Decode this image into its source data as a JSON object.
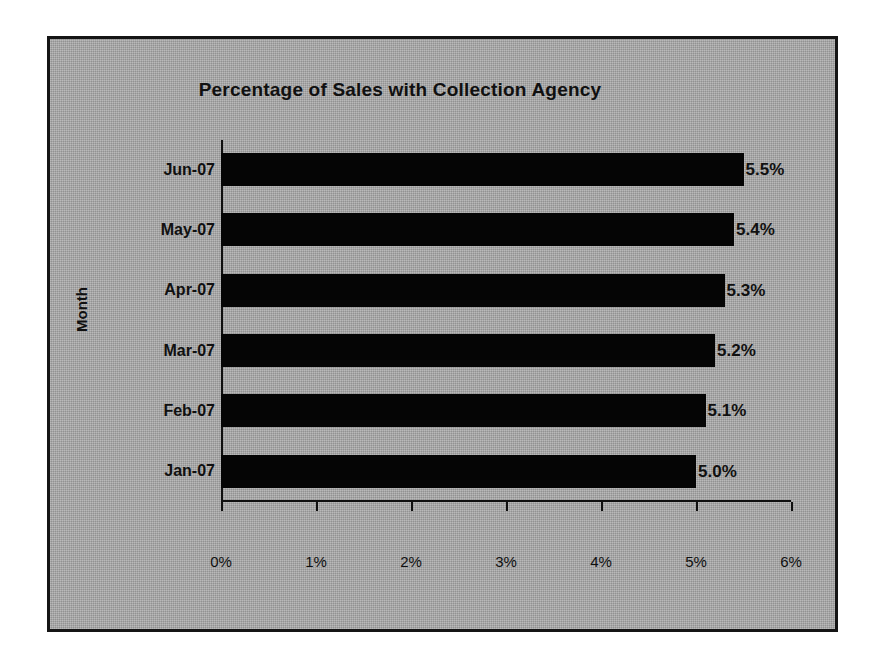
{
  "chart_data": {
    "type": "bar",
    "orientation": "horizontal",
    "title": "Percentage of Sales with Collection Agency",
    "xlabel": "",
    "ylabel": "Month",
    "categories": [
      "Jun-07",
      "May-07",
      "Apr-07",
      "Mar-07",
      "Feb-07",
      "Jan-07"
    ],
    "values": [
      5.5,
      5.4,
      5.3,
      5.2,
      5.1,
      5.0
    ],
    "data_labels": [
      "5.5%",
      "5.4%",
      "5.3%",
      "5.2%",
      "5.1%",
      "5.0%"
    ],
    "xlim": [
      0,
      6
    ],
    "x_tick_labels": [
      "0%",
      "1%",
      "2%",
      "3%",
      "4%",
      "5%",
      "6%"
    ],
    "x_tick_values": [
      0,
      1,
      2,
      3,
      4,
      5,
      6
    ],
    "grid": false,
    "legend": false,
    "series": [
      {
        "name": "Percentage of Sales with Collection Agency",
        "values": [
          5.5,
          5.4,
          5.3,
          5.2,
          5.1,
          5.0
        ]
      }
    ],
    "colors": {
      "bar": "#050505",
      "plot_background": "#a9a9a9",
      "chart_background": "#a9a9a9",
      "border": "#151515",
      "text": "#101010",
      "page_background": "#ffffff"
    }
  }
}
